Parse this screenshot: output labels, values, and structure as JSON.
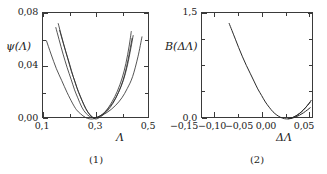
{
  "figure": {
    "panels": [
      {
        "caption": "(1)",
        "ylabel": "ψ(Λ)",
        "xlabel": "Λ",
        "y_ticks": [
          "0,08",
          "0,04",
          "0,00"
        ],
        "x_ticks": [
          "0,1",
          "0,3",
          "0,5"
        ]
      },
      {
        "caption": "(2)",
        "ylabel": "B(ΔΛ)",
        "xlabel": "ΔΛ",
        "y_ticks": [
          "1,5",
          "0,0"
        ],
        "x_ticks": [
          "−0,15",
          "−0,10",
          "−0,05",
          "0,00",
          "0,05"
        ]
      }
    ]
  },
  "chart_data": [
    {
      "type": "line",
      "title": "(1)",
      "xlabel": "Λ",
      "ylabel": "ψ(Λ)",
      "xlim": [
        0.1,
        0.5
      ],
      "ylim": [
        0.0,
        0.08
      ],
      "xticks": [
        0.1,
        0.3,
        0.5
      ],
      "xticklabels": [
        "0,1",
        "0,3",
        "0,5"
      ],
      "yticks": [
        0.0,
        0.04,
        0.08
      ],
      "yticklabels": [
        "0,00",
        "0,04",
        "0,08"
      ],
      "xminor": [
        0.2,
        0.4
      ],
      "yminor": [
        0.02,
        0.06
      ],
      "grid": false,
      "legend": "none",
      "series": [
        {
          "name": "curve-1",
          "x": [
            0.113,
            0.13,
            0.15,
            0.17,
            0.19,
            0.21,
            0.225,
            0.24,
            0.26,
            0.285,
            0.31,
            0.34,
            0.37,
            0.395,
            0.415,
            0.435,
            0.455,
            0.47
          ],
          "y": [
            0.059,
            0.049,
            0.038,
            0.029,
            0.02,
            0.012,
            0.007,
            0.004,
            0.001,
            0.0,
            0.002,
            0.005,
            0.01,
            0.016,
            0.023,
            0.032,
            0.047,
            0.062
          ]
        },
        {
          "name": "curve-2",
          "x": [
            0.148,
            0.16,
            0.175,
            0.19,
            0.205,
            0.218,
            0.23,
            0.245,
            0.262,
            0.285,
            0.31,
            0.335,
            0.36,
            0.382,
            0.4,
            0.415,
            0.428,
            0.437
          ],
          "y": [
            0.069,
            0.06,
            0.049,
            0.039,
            0.03,
            0.022,
            0.016,
            0.009,
            0.004,
            0.001,
            0.002,
            0.006,
            0.012,
            0.02,
            0.029,
            0.04,
            0.053,
            0.063
          ]
        },
        {
          "name": "curve-3",
          "x": [
            0.157,
            0.17,
            0.185,
            0.2,
            0.213,
            0.226,
            0.238,
            0.252,
            0.268,
            0.29,
            0.312,
            0.335,
            0.358,
            0.378,
            0.396,
            0.41,
            0.422,
            0.43
          ],
          "y": [
            0.072,
            0.062,
            0.051,
            0.041,
            0.032,
            0.024,
            0.018,
            0.011,
            0.005,
            0.001,
            0.002,
            0.006,
            0.013,
            0.021,
            0.031,
            0.042,
            0.055,
            0.066
          ]
        },
        {
          "name": "curve-4",
          "x": [
            0.162,
            0.176,
            0.192,
            0.206,
            0.22,
            0.233,
            0.246,
            0.26,
            0.276,
            0.296,
            0.318,
            0.34,
            0.362,
            0.382,
            0.399,
            0.412,
            0.424,
            0.433
          ],
          "y": [
            0.067,
            0.057,
            0.046,
            0.036,
            0.028,
            0.02,
            0.014,
            0.008,
            0.003,
            0.0,
            0.002,
            0.006,
            0.012,
            0.02,
            0.029,
            0.039,
            0.051,
            0.061
          ]
        }
      ]
    },
    {
      "type": "line",
      "title": "(2)",
      "xlabel": "ΔΛ",
      "ylabel": "B(ΔΛ)",
      "xlim": [
        -0.175,
        0.06
      ],
      "ylim": [
        0.0,
        1.62
      ],
      "xticks": [
        -0.15,
        -0.1,
        -0.05,
        0.0,
        0.05
      ],
      "xticklabels": [
        "−0,15",
        "−0,10",
        "−0,05",
        "0,00",
        "0,05"
      ],
      "yticks": [
        0.0,
        1.5
      ],
      "yticklabels": [
        "0,0",
        "1,5"
      ],
      "xminor": [
        -0.125,
        -0.075,
        -0.025,
        0.025
      ],
      "yminor": [
        0.375,
        0.75,
        1.125
      ],
      "grid": false,
      "legend": "none",
      "series": [
        {
          "name": "curve-main",
          "x": [
            -0.118,
            -0.112,
            -0.105,
            -0.098,
            -0.09,
            -0.082,
            -0.074,
            -0.066,
            -0.058,
            -0.05,
            -0.042,
            -0.034,
            -0.026,
            -0.018,
            -0.01,
            -0.002,
            0.006,
            0.014,
            0.022,
            0.03,
            0.038,
            0.046,
            0.052
          ],
          "y": [
            1.46,
            1.35,
            1.22,
            1.09,
            0.95,
            0.82,
            0.7,
            0.58,
            0.46,
            0.36,
            0.26,
            0.18,
            0.11,
            0.06,
            0.025,
            0.005,
            0.002,
            0.012,
            0.032,
            0.06,
            0.095,
            0.138,
            0.172
          ]
        },
        {
          "name": "curve-branch-a",
          "x": [
            0.006,
            0.014,
            0.022,
            0.03,
            0.038,
            0.046,
            0.052
          ],
          "y": [
            0.004,
            0.02,
            0.048,
            0.088,
            0.14,
            0.205,
            0.258
          ]
        },
        {
          "name": "curve-branch-b",
          "x": [
            0.01,
            0.018,
            0.026,
            0.034,
            0.042,
            0.05,
            0.054
          ],
          "y": [
            0.008,
            0.03,
            0.065,
            0.112,
            0.172,
            0.242,
            0.285
          ]
        }
      ]
    }
  ]
}
